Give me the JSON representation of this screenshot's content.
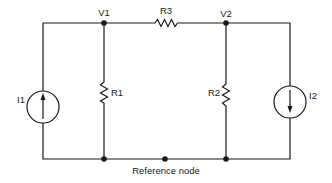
{
  "diagram": {
    "type": "circuit",
    "nodes": {
      "v1": {
        "label": "V1"
      },
      "v2": {
        "label": "V2"
      },
      "reference": {
        "label": "Reference node"
      }
    },
    "components": {
      "r1": {
        "label": "R1",
        "kind": "resistor",
        "between": [
          "V1",
          "Reference node"
        ]
      },
      "r2": {
        "label": "R2",
        "kind": "resistor",
        "between": [
          "V2",
          "Reference node"
        ]
      },
      "r3": {
        "label": "R3",
        "kind": "resistor",
        "between": [
          "V1",
          "V2"
        ]
      },
      "i1": {
        "label": "I1",
        "kind": "current-source",
        "direction": "up",
        "between": [
          "Reference node",
          "V1"
        ]
      },
      "i2": {
        "label": "I2",
        "kind": "current-source",
        "direction": "down",
        "between": [
          "V2",
          "Reference node"
        ]
      }
    },
    "colors": {
      "line": "#1a1a1a",
      "background": "#ffffff"
    }
  }
}
